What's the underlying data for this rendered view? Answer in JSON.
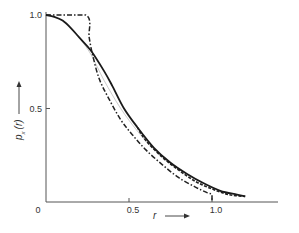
{
  "chart_data": {
    "type": "line",
    "title": "",
    "xlabel": "r",
    "ylabel": "p_x (r)",
    "xlim": [
      0,
      1.4
    ],
    "ylim": [
      0,
      1.0
    ],
    "grid": false,
    "legend": null,
    "x_ticks": [
      {
        "value": 0,
        "label": "0"
      },
      {
        "value": 0.5,
        "label": "0.5"
      },
      {
        "value": 1.0,
        "label": "1.0"
      }
    ],
    "y_ticks": [
      {
        "value": 0.5,
        "label": "0.5"
      },
      {
        "value": 1.0,
        "label": "1.0"
      }
    ],
    "series": [
      {
        "name": "solid",
        "style": "solid-thick",
        "x": [
          0,
          0.05,
          0.1,
          0.15,
          0.2,
          0.27,
          0.35,
          0.4,
          0.47,
          0.55,
          0.65,
          0.75,
          0.85,
          0.95,
          1.05,
          1.15,
          1.2
        ],
        "y": [
          1.0,
          0.99,
          0.97,
          0.93,
          0.88,
          0.81,
          0.7,
          0.62,
          0.5,
          0.4,
          0.29,
          0.21,
          0.15,
          0.1,
          0.06,
          0.04,
          0.03
        ]
      },
      {
        "name": "dash-dot",
        "style": "dash-dot",
        "x": [
          0,
          0.24,
          0.26,
          0.28,
          0.32,
          0.38,
          0.45,
          0.52,
          0.6,
          0.7,
          0.8,
          0.9,
          0.97,
          1.0,
          1.0
        ],
        "y": [
          1.0,
          1.0,
          0.88,
          0.79,
          0.66,
          0.55,
          0.44,
          0.36,
          0.28,
          0.2,
          0.13,
          0.08,
          0.05,
          0.04,
          0.01
        ]
      },
      {
        "name": "dashed",
        "style": "dashed",
        "x": [
          0.55,
          0.6,
          0.7,
          0.8,
          0.9,
          1.0,
          1.1,
          1.2
        ],
        "y": [
          0.4,
          0.33,
          0.24,
          0.17,
          0.11,
          0.07,
          0.04,
          0.03
        ]
      },
      {
        "name": "thin-grey",
        "style": "thin",
        "x": [
          0.2,
          0.27,
          0.35,
          0.45,
          0.55,
          0.65
        ],
        "y": [
          0.88,
          0.79,
          0.65,
          0.5,
          0.38,
          0.28
        ]
      }
    ],
    "annotations": [
      {
        "text": "r",
        "arrow": "right",
        "position": "below x-axis"
      },
      {
        "text": "p_x (r)",
        "arrow": "up",
        "position": "left of y-axis"
      }
    ]
  }
}
